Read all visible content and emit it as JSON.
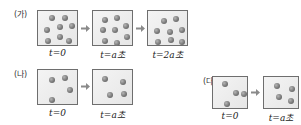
{
  "panels": [
    {
      "label": "(가)",
      "frames": [
        {
          "caption": "t=0",
          "particles": [
            [
              11,
              4
            ],
            [
              24,
              4
            ],
            [
              6,
              16
            ],
            [
              19,
              13
            ],
            [
              31,
              12
            ],
            [
              7,
              27
            ],
            [
              19,
              23
            ],
            [
              28,
              27
            ]
          ]
        },
        {
          "caption": "t=a초",
          "particles": [
            [
              9,
              6
            ],
            [
              21,
              4
            ],
            [
              7,
              16
            ],
            [
              19,
              16
            ],
            [
              30,
              12
            ],
            [
              9,
              27
            ],
            [
              21,
              29
            ],
            [
              31,
              23
            ]
          ]
        },
        {
          "caption": "t=2a초",
          "particles": [
            [
              13,
              7
            ],
            [
              25,
              5
            ],
            [
              6,
              17
            ],
            [
              19,
              18
            ],
            [
              31,
              16
            ],
            [
              7,
              28
            ],
            [
              20,
              26
            ],
            [
              31,
              28
            ]
          ]
        }
      ]
    },
    {
      "label": "(나)",
      "frames": [
        {
          "caption": "t=0",
          "particles": [
            [
              11,
              7
            ],
            [
              24,
              5
            ],
            [
              29,
              17
            ],
            [
              11,
              27
            ]
          ]
        },
        {
          "caption": "t=a초",
          "particles": [
            [
              9,
              6
            ],
            [
              27,
              9
            ],
            [
              14,
              22
            ],
            [
              28,
              21
            ]
          ]
        }
      ]
    },
    {
      "label": "(다)",
      "frames": [
        {
          "caption": "t=0",
          "particles": [
            [
              9,
              4
            ],
            [
              20,
              13
            ],
            [
              28,
              14
            ],
            [
              11,
              24
            ]
          ]
        },
        {
          "caption": "t=a초",
          "particles": [
            [
              10,
              6
            ],
            [
              25,
              9
            ],
            [
              12,
              17
            ],
            [
              24,
              21
            ]
          ]
        }
      ]
    }
  ],
  "colors": {
    "box_border": "#6e6e6e",
    "box_fill": "#ececec",
    "particle": "#7a7a7a",
    "arrow": "#8a8a8a"
  }
}
